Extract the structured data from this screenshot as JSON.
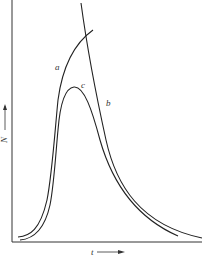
{
  "diagram": {
    "axes": {
      "y_label": "N",
      "x_label": "t",
      "y_arrow": "up-arrow",
      "x_arrow": "right-arrow"
    },
    "curves": [
      {
        "id": "a",
        "label": "a",
        "description": "rising curve reaching top, intersecting curve b"
      },
      {
        "id": "b",
        "label": "b",
        "description": "steep descending curve from top, decaying to baseline"
      },
      {
        "id": "c",
        "label": "c",
        "description": "peaked curve rising and decaying to baseline"
      }
    ]
  }
}
